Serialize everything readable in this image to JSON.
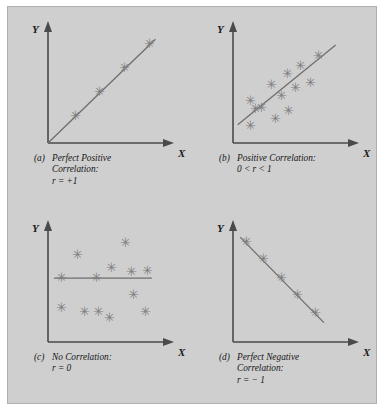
{
  "figure": {
    "background_color": "#cfcfcf",
    "border_color": "#b0b0b0",
    "axis_color": "#4a4a4a",
    "marker_color": "#7d7d7d",
    "trend_color": "#6e6e6e",
    "marker_glyph": "✳"
  },
  "chart_data": [
    {
      "type": "scatter",
      "id": "a",
      "tag": "(a)",
      "title_line1": "Perfect Positive",
      "title_line2": "Correlation:",
      "stat": "r = +1",
      "xlabel": "X",
      "ylabel": "Y",
      "xlim": [
        0,
        10
      ],
      "ylim": [
        0,
        10
      ],
      "grid": false,
      "legend": "none",
      "points": [
        {
          "x": 2.3,
          "y": 2.3
        },
        {
          "x": 4.4,
          "y": 4.4
        },
        {
          "x": 6.5,
          "y": 6.5
        },
        {
          "x": 8.6,
          "y": 8.6
        }
      ],
      "trend": {
        "x1": 0.0,
        "y1": 0.0,
        "x2": 9.1,
        "y2": 9.1
      }
    },
    {
      "type": "scatter",
      "id": "b",
      "tag": "(b)",
      "title_line1": "Positive Correlation:",
      "title_line2": "",
      "stat": "0 < r < 1",
      "xlabel": "X",
      "ylabel": "Y",
      "xlim": [
        0,
        10
      ],
      "ylim": [
        0,
        10
      ],
      "grid": false,
      "legend": "none",
      "points": [
        {
          "x": 1.5,
          "y": 1.4
        },
        {
          "x": 1.5,
          "y": 3.6
        },
        {
          "x": 1.9,
          "y": 2.9
        },
        {
          "x": 2.4,
          "y": 3.0
        },
        {
          "x": 3.3,
          "y": 5.0
        },
        {
          "x": 3.6,
          "y": 2.1
        },
        {
          "x": 4.1,
          "y": 4.1
        },
        {
          "x": 4.6,
          "y": 6.0
        },
        {
          "x": 4.7,
          "y": 2.8
        },
        {
          "x": 5.3,
          "y": 4.8
        },
        {
          "x": 5.7,
          "y": 6.7
        },
        {
          "x": 6.6,
          "y": 5.2
        },
        {
          "x": 7.2,
          "y": 7.6
        }
      ],
      "trend": {
        "x1": 0.4,
        "y1": 1.6,
        "x2": 8.7,
        "y2": 8.6
      }
    },
    {
      "type": "scatter",
      "id": "c",
      "tag": "(c)",
      "title_line1": "No Correlation:",
      "title_line2": "",
      "stat": "r = 0",
      "xlabel": "X",
      "ylabel": "Y",
      "xlim": [
        0,
        10
      ],
      "ylim": [
        0,
        10
      ],
      "grid": false,
      "legend": "none",
      "points": [
        {
          "x": 1.1,
          "y": 5.6
        },
        {
          "x": 1.1,
          "y": 2.9
        },
        {
          "x": 2.5,
          "y": 7.6
        },
        {
          "x": 3.1,
          "y": 2.6
        },
        {
          "x": 4.1,
          "y": 5.6
        },
        {
          "x": 4.3,
          "y": 2.6
        },
        {
          "x": 5.2,
          "y": 2.1
        },
        {
          "x": 5.4,
          "y": 6.4
        },
        {
          "x": 6.6,
          "y": 8.6
        },
        {
          "x": 7.1,
          "y": 6.1
        },
        {
          "x": 7.2,
          "y": 4.1
        },
        {
          "x": 8.3,
          "y": 2.6
        },
        {
          "x": 8.4,
          "y": 6.2
        }
      ],
      "trend": {
        "x1": 0.5,
        "y1": 5.6,
        "x2": 8.8,
        "y2": 5.6
      }
    },
    {
      "type": "scatter",
      "id": "d",
      "tag": "(d)",
      "title_line1": "Perfect Negative",
      "title_line2": "Correlation:",
      "stat": "r = − 1",
      "xlabel": "X",
      "ylabel": "Y",
      "xlim": [
        0,
        10
      ],
      "ylim": [
        0,
        10
      ],
      "grid": false,
      "legend": "none",
      "points": [
        {
          "x": 1.1,
          "y": 8.7
        },
        {
          "x": 2.6,
          "y": 7.2
        },
        {
          "x": 4.1,
          "y": 5.6
        },
        {
          "x": 5.5,
          "y": 4.1
        },
        {
          "x": 7.0,
          "y": 2.5
        }
      ],
      "trend": {
        "x1": 0.6,
        "y1": 9.2,
        "x2": 7.7,
        "y2": 1.7
      }
    }
  ]
}
